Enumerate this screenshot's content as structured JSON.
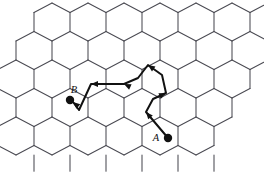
{
  "figure": {
    "background_color": "#ffffff",
    "width": 264,
    "height": 191
  },
  "lattice": {
    "name": "hexagonal-lattice",
    "orientation": "pointy-top",
    "edge_color": "#4a4a52",
    "edge_width": 1.05,
    "hex_width": 36,
    "hex_height": 38,
    "columns": 7,
    "rows": 5,
    "shape": "rhombus"
  },
  "nodes": [
    {
      "id": "A",
      "label": "A",
      "x": 168,
      "y": 138,
      "radius": 4.2,
      "color": "#111111",
      "label_dx": -12,
      "label_dy": 3
    },
    {
      "id": "B",
      "label": "B",
      "x": 70,
      "y": 100,
      "radius": 4.2,
      "color": "#111111",
      "label_dx": 4,
      "label_dy": -7
    }
  ],
  "path": {
    "name": "walk-from-a-to-b",
    "color": "#111111",
    "width": 2.0,
    "direction": "A to B",
    "vertices": [
      [
        168,
        138
      ],
      [
        146,
        112
      ],
      [
        153,
        99
      ],
      [
        166,
        93
      ],
      [
        162,
        75
      ],
      [
        148,
        65
      ],
      [
        138,
        78
      ],
      [
        124,
        84
      ],
      [
        91,
        84
      ],
      [
        79,
        110
      ],
      [
        73,
        102
      ]
    ],
    "arrows": [
      {
        "at": [
          146,
          112
        ],
        "angle": 230
      },
      {
        "at": [
          166,
          93
        ],
        "angle": 335
      },
      {
        "at": [
          148,
          65
        ],
        "angle": 215
      },
      {
        "at": [
          124,
          84
        ],
        "angle": 205
      },
      {
        "at": [
          91,
          84
        ],
        "angle": 180
      },
      {
        "at": [
          73,
          102
        ],
        "angle": 220
      }
    ]
  },
  "chart_data": {
    "type": "diagram",
    "start_point": "A",
    "end_point": "B",
    "segment_count": 10
  }
}
